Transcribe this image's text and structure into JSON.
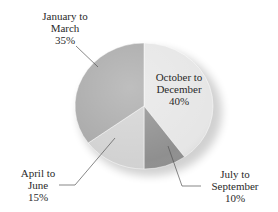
{
  "chart_data": {
    "type": "pie",
    "title": "",
    "categories": [
      "January to March",
      "April to June",
      "July to September",
      "October to December"
    ],
    "values": [
      35,
      15,
      10,
      40
    ],
    "unit": "%",
    "colors": [
      "#a9a9a9",
      "#d2d2d2",
      "#8f8f8f",
      "#e6e6e6"
    ],
    "labels": [
      {
        "name": "January to March",
        "line1": "January to",
        "line2": "March",
        "pct": "35%"
      },
      {
        "name": "April to June",
        "line1": "April to",
        "line2": "June",
        "pct": "15%"
      },
      {
        "name": "July to September",
        "line1": "July to",
        "line2": "September",
        "pct": "10%"
      },
      {
        "name": "October to December",
        "line1": "October to",
        "line2": "December",
        "pct": "40%"
      }
    ],
    "style": "3d-shaded pie, grayscale, leader lines to outside labels"
  }
}
